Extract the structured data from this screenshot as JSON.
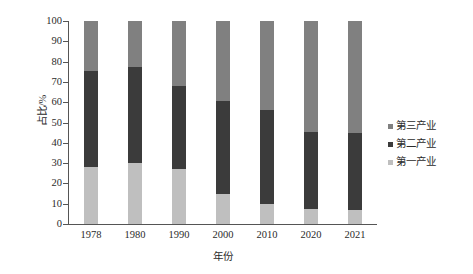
{
  "chart_data": {
    "type": "bar",
    "stacked": true,
    "title": "",
    "categories": [
      "1978",
      "1980",
      "1990",
      "2000",
      "2010",
      "2020",
      "2021"
    ],
    "series": [
      {
        "name": "第一产业",
        "color": "#bfbfbf",
        "values": [
          28.0,
          30.0,
          27.0,
          15.0,
          10.0,
          7.5,
          7.0
        ]
      },
      {
        "name": "第二产业",
        "color": "#3b3b3b",
        "values": [
          47.5,
          47.5,
          41.0,
          45.5,
          46.0,
          38.0,
          38.0
        ]
      },
      {
        "name": "第三产业",
        "color": "#808080",
        "values": [
          24.5,
          22.5,
          32.0,
          39.5,
          44.0,
          54.5,
          55.0
        ]
      }
    ],
    "xlabel": "年份",
    "ylabel": "占比/%",
    "ylim": [
      0,
      100
    ],
    "yticks": [
      0,
      10,
      20,
      30,
      40,
      50,
      60,
      70,
      80,
      90,
      100
    ],
    "grid": false,
    "legend_position": "right"
  },
  "axes": {
    "y_label": "占比/%",
    "x_label": "年份",
    "y_tick_labels": [
      "100",
      "90",
      "80",
      "70",
      "60",
      "50",
      "40",
      "30",
      "20",
      "10",
      "0"
    ],
    "x_tick_labels": [
      "1978",
      "1980",
      "1990",
      "2000",
      "2010",
      "2020",
      "2021"
    ]
  },
  "legend": {
    "items": [
      {
        "label": "第三产业",
        "color": "#808080"
      },
      {
        "label": "第二产业",
        "color": "#3b3b3b"
      },
      {
        "label": "第一产业",
        "color": "#bfbfbf"
      }
    ]
  }
}
